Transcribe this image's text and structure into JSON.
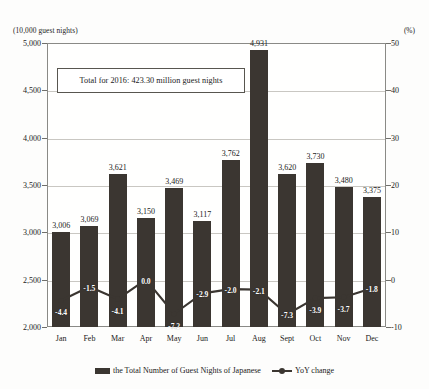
{
  "axis": {
    "left_unit": "(10,000 guest nights)",
    "right_unit": "(%)"
  },
  "callout": {
    "text": "Total for 2016: 423.30 million guest nights"
  },
  "legend": {
    "bar_label": "the Total Number of Guest Nights of Japanese",
    "line_label": "YoY change"
  },
  "chart_data": {
    "type": "bar",
    "title": "",
    "subtitle": "",
    "xlabel": "",
    "ylabel": "(10,000 guest nights)",
    "y2label": "(%)",
    "ylim": [
      2000,
      5000
    ],
    "y2lim": [
      -10,
      50
    ],
    "yticks": [
      "2,000",
      "2,500",
      "3,000",
      "3,500",
      "4,000",
      "4,500",
      "5,000"
    ],
    "ytick_values": [
      2000,
      2500,
      3000,
      3500,
      4000,
      4500,
      5000
    ],
    "y2ticks": [
      "-10",
      "0",
      "10",
      "20",
      "30",
      "40",
      "50"
    ],
    "y2tick_values": [
      -10,
      0,
      10,
      20,
      30,
      40,
      50
    ],
    "grid": true,
    "legend_position": "bottom",
    "categories": [
      "Jan",
      "Feb",
      "Mar",
      "Apr",
      "May",
      "Jun",
      "Jul",
      "Aug",
      "Sept",
      "Oct",
      "Nov",
      "Dec"
    ],
    "series": [
      {
        "name": "the Total Number of Guest Nights of Japanese",
        "type": "bar",
        "axis": "left",
        "values": [
          3006,
          3069,
          3621,
          3150,
          3469,
          3117,
          3762,
          4931,
          3620,
          3730,
          3480,
          3375
        ],
        "labels": [
          "3,006",
          "3,069",
          "3,621",
          "3,150",
          "3,469",
          "3,117",
          "3,762",
          "4,931",
          "3,620",
          "3,730",
          "3,480",
          "3,375"
        ],
        "color": "#3b3631"
      },
      {
        "name": "YoY change",
        "type": "line",
        "axis": "right",
        "values": [
          -4.4,
          -1.5,
          -4.1,
          0.0,
          -7.2,
          -2.9,
          -2.0,
          -2.1,
          -7.3,
          -3.9,
          -3.7,
          -1.8
        ],
        "labels": [
          "-4.4",
          "-1.5",
          "-4.1",
          "0.0",
          "-7.2",
          "-2.9",
          "-2.0",
          "-2.1",
          "-7.3",
          "-3.9",
          "-3.7",
          "-1.8"
        ],
        "color": "#3b3631"
      }
    ],
    "annotations": [
      {
        "text": "Total for 2016: 423.30 million guest nights"
      }
    ]
  }
}
